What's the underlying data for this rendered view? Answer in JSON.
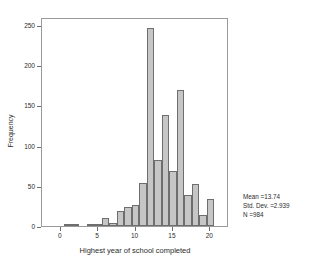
{
  "chart_data": {
    "type": "bar",
    "title": "",
    "subtitle": "",
    "xlabel": "Highest year of school completed",
    "ylabel": "Frequency",
    "xlim": [
      -2.5,
      22.5
    ],
    "ylim": [
      0,
      260
    ],
    "xticks": [
      0,
      5,
      10,
      15,
      20
    ],
    "xtick_labels": [
      "0",
      "5",
      "10",
      "15",
      "20"
    ],
    "yticks": [
      0,
      50,
      100,
      150,
      200,
      250
    ],
    "ytick_labels": [
      "0",
      "50",
      "100",
      "150",
      "200",
      "250"
    ],
    "grid": false,
    "legend": null,
    "bar_fill_color": "#c6c6c6",
    "bar_edge_color": "#6e6e6e",
    "axis_color": "#9a9a9a",
    "bin_width": 1,
    "categories": [
      0,
      1,
      2,
      3,
      4,
      5,
      6,
      7,
      8,
      9,
      10,
      11,
      12,
      13,
      14,
      15,
      16,
      17,
      18,
      19,
      20
    ],
    "values": [
      0,
      1,
      2,
      0,
      1,
      2,
      10,
      4,
      19,
      24,
      26,
      53,
      246,
      82,
      138,
      69,
      169,
      38,
      52,
      14,
      34
    ],
    "annotations": {
      "mean_label": "Mean =13.74",
      "std_dev_label": "Std. Dev. =2.939",
      "n_label": "N =984",
      "mean": 13.74,
      "std_dev": 2.939,
      "n": 984
    }
  }
}
